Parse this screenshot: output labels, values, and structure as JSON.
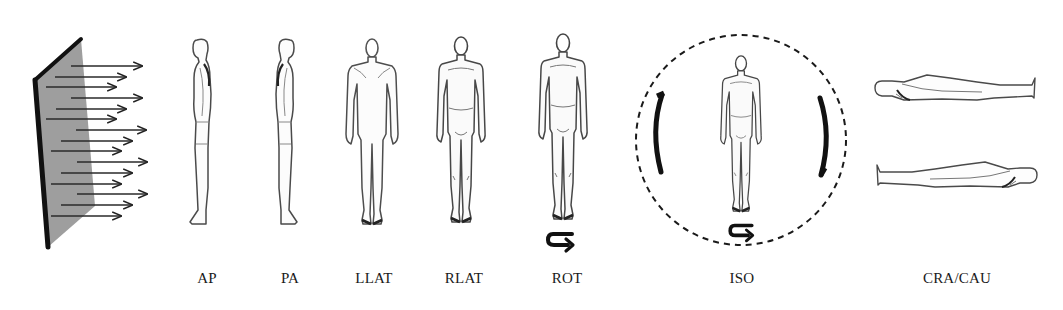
{
  "figure": {
    "type": "irradiation-geometry-diagram",
    "source": {
      "description": "planar parallel beam source",
      "arrow_count": 15
    },
    "geometries": [
      {
        "id": "ap",
        "label": "AP",
        "view": "side-facing-left",
        "x": 205
      },
      {
        "id": "pa",
        "label": "PA",
        "view": "side-facing-right",
        "x": 288
      },
      {
        "id": "llat",
        "label": "LLAT",
        "view": "back",
        "x": 372
      },
      {
        "id": "rlat",
        "label": "RLAT",
        "view": "front",
        "x": 462
      },
      {
        "id": "rot",
        "label": "ROT",
        "view": "front",
        "x": 563,
        "rotation_arrow": true
      },
      {
        "id": "iso",
        "label": "ISO",
        "view": "front",
        "x": 741,
        "rotation_arrow": true,
        "dashed_sphere": true
      },
      {
        "id": "cra-cau",
        "label": "CRA/CAU",
        "view": "lying-horizontal",
        "x": 955
      }
    ]
  },
  "colors": {
    "ink": "#1a1a1a",
    "plane_fill": "#9a9a9a",
    "plane_edge": "#111111",
    "figure_stroke": "#4a4a4a",
    "background": "#ffffff"
  }
}
